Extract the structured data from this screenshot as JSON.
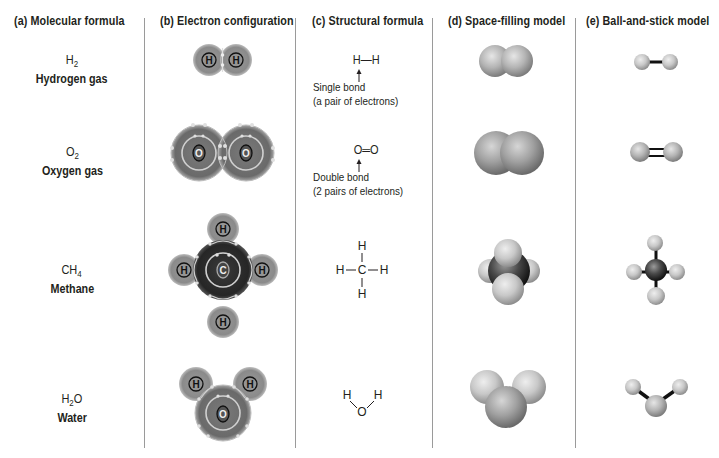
{
  "headers": {
    "a": "(a)  Molecular formula",
    "b": "(b)  Electron configuration",
    "c": "(c)  Structural formula",
    "d": "(d)  Space-filling model",
    "e": "(e)  Ball-and-stick model"
  },
  "molecules": [
    {
      "formula_base": "H",
      "formula_sub": "2",
      "formula_tail": "",
      "name": "Hydrogen gas",
      "electron_atoms": [
        "H",
        "H"
      ],
      "structural": "H—H",
      "bond_note_1": "Single bond",
      "bond_note_2": "(a pair of electrons)"
    },
    {
      "formula_base": "O",
      "formula_sub": "2",
      "formula_tail": "",
      "name": "Oxygen gas",
      "electron_atoms": [
        "O",
        "O"
      ],
      "structural": "O═O",
      "bond_note_1": "Double bond",
      "bond_note_2": "(2 pairs of electrons)"
    },
    {
      "formula_base": "CH",
      "formula_sub": "4",
      "formula_tail": "",
      "name": "Methane",
      "electron_atoms": [
        "C",
        "H",
        "H",
        "H",
        "H"
      ],
      "structural_atoms": [
        "H",
        "H",
        "C",
        "H",
        "H"
      ]
    },
    {
      "formula_base": "H",
      "formula_sub": "2",
      "formula_tail": "O",
      "name": "Water",
      "electron_atoms": [
        "O",
        "H",
        "H"
      ],
      "structural_atoms": [
        "H",
        "O",
        "H"
      ]
    }
  ],
  "colors": {
    "text": "#231f20",
    "divider": "#9a9a9a",
    "hydrogen_shell": "#8c8c8c",
    "oxygen_shell": "#6e6e6e",
    "carbon_shell": "#2e2e2e",
    "electron": "#d8d8d8"
  }
}
